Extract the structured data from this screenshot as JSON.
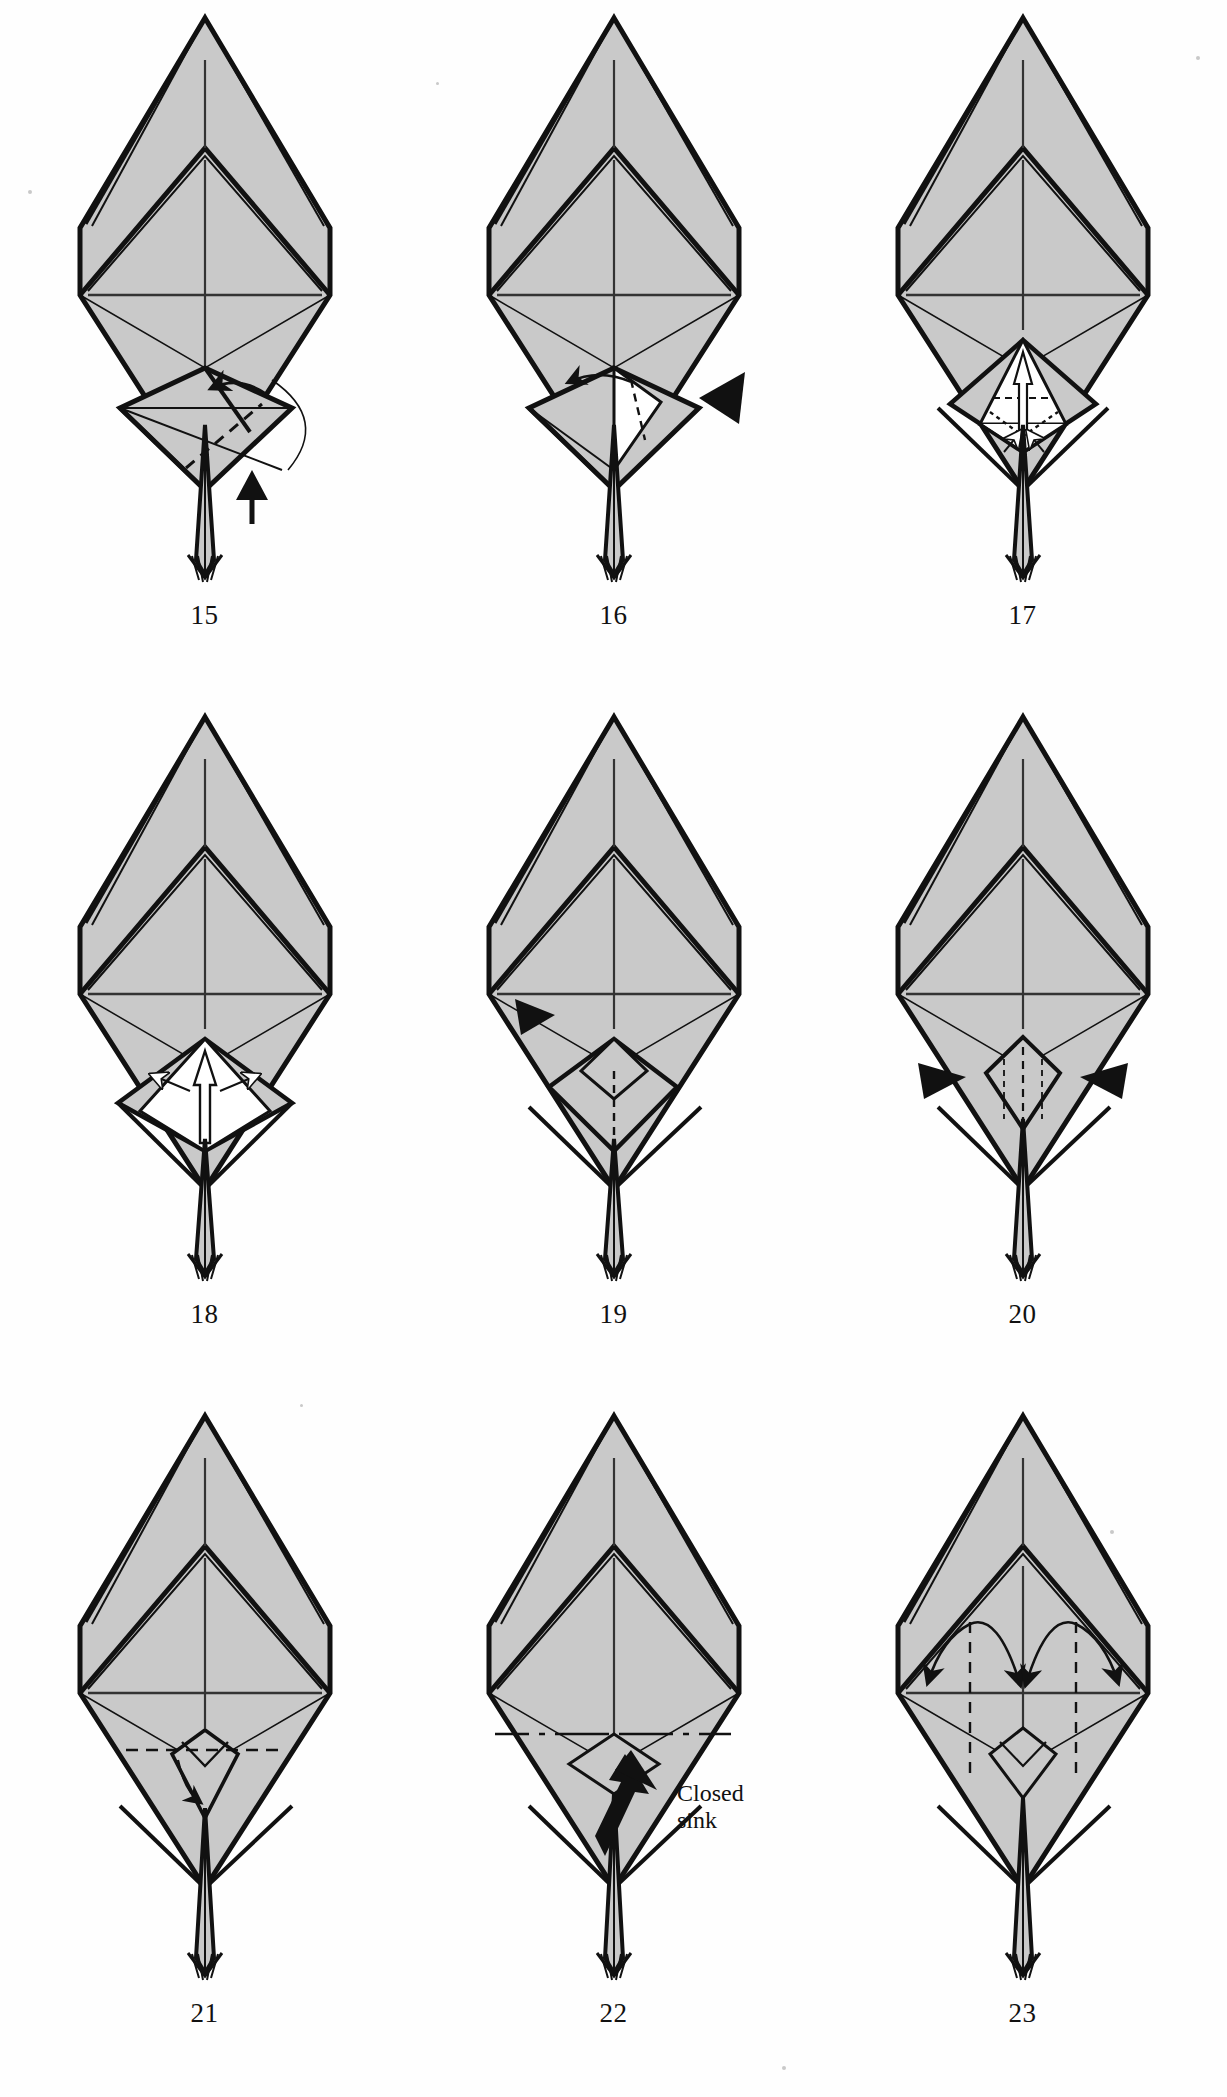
{
  "document": {
    "kind": "origami-folding-diagram",
    "page_steps": 9,
    "paper_fill": "#c9c9c9",
    "ink": "#111111",
    "white_fill": "#ffffff"
  },
  "steps": [
    {
      "number": "15",
      "id": "step-15",
      "row": 1,
      "col": 1,
      "annotations": [
        "valley-fold-arrow-left",
        "rotation-arc",
        "black-push-arrow"
      ],
      "description": "Swing flap across, petal fold in progress"
    },
    {
      "number": "16",
      "id": "step-16",
      "row": 1,
      "col": 2,
      "annotations": [
        "valley-fold-arrow-left",
        "black-push-arrowhead-right",
        "white-flap"
      ],
      "description": "Push in at the side, flap shown white"
    },
    {
      "number": "17",
      "id": "step-17",
      "row": 1,
      "col": 3,
      "annotations": [
        "white-up-arrow",
        "dotted-fold-lines",
        "small-white-arrows"
      ],
      "description": "Open out the white pocket upward"
    },
    {
      "number": "18",
      "id": "step-18",
      "row": 2,
      "col": 1,
      "annotations": [
        "white-up-arrow",
        "outward-white-arrows"
      ],
      "description": "Spread the white flaps outward"
    },
    {
      "number": "19",
      "id": "step-19",
      "row": 2,
      "col": 2,
      "annotations": [
        "black-push-arrowhead-left",
        "dotted-fold-lines"
      ],
      "description": "Press at the left edge"
    },
    {
      "number": "20",
      "id": "step-20",
      "row": 2,
      "col": 3,
      "annotations": [
        "black-push-arrowhead-left",
        "black-push-arrowhead-right",
        "dashed-fold-lines"
      ],
      "description": "Push in at both sides"
    },
    {
      "number": "21",
      "id": "step-21",
      "row": 3,
      "col": 1,
      "annotations": [
        "dashed-horizontal-fold-line",
        "small-curved-arrow"
      ],
      "description": "Fold the small point down"
    },
    {
      "number": "22",
      "id": "step-22",
      "row": 3,
      "col": 2,
      "annotations": [
        "dash-dot-fold-line",
        "large-black-arrow",
        "label-closed-sink"
      ],
      "label": "Closed\nsink",
      "label_line_1": "Closed",
      "label_line_2": "sink",
      "description": "Closed sink along the dash-dot line"
    },
    {
      "number": "23",
      "id": "step-23",
      "row": 3,
      "col": 3,
      "annotations": [
        "left-arc-arrow",
        "right-arc-arrow",
        "dashed-vertical-fold-lines"
      ],
      "description": "Swing the two flaps out to the sides"
    }
  ],
  "captions": {
    "c15": "15",
    "c16": "16",
    "c17": "17",
    "c18": "18",
    "c19": "19",
    "c20": "20",
    "c21": "21",
    "c22": "22",
    "c23": "23"
  },
  "text_labels": {
    "closed_sink_line1": "Closed",
    "closed_sink_line2": "sink"
  },
  "colors": {
    "paper": "#c9c9c9",
    "paper_dark": "#bdbdbd",
    "outline": "#111111",
    "white": "#ffffff"
  }
}
